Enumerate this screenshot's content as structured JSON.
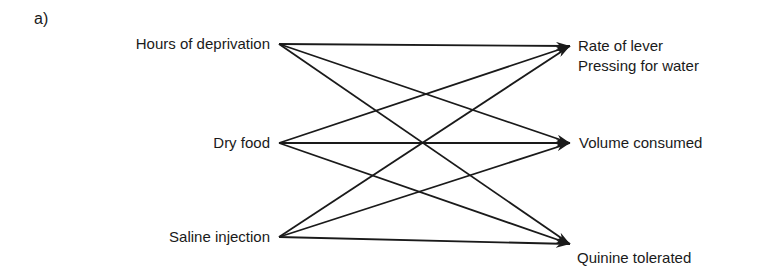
{
  "panel_label": "a)",
  "sources": [
    {
      "id": "hours",
      "label": "Hours of deprivation",
      "y": 44
    },
    {
      "id": "dry",
      "label": "Dry food",
      "y": 143
    },
    {
      "id": "saline",
      "label": "Saline injection",
      "y": 237
    }
  ],
  "targets": [
    {
      "id": "rate",
      "label_line1": "Rate of lever",
      "label_line2": "Pressing for water",
      "y": 46
    },
    {
      "id": "volume",
      "label": "Volume consumed",
      "y": 143
    },
    {
      "id": "quinine",
      "label": "Quinine tolerated",
      "y": 244
    }
  ],
  "edges": [
    {
      "from": "hours",
      "to": "rate"
    },
    {
      "from": "hours",
      "to": "volume"
    },
    {
      "from": "hours",
      "to": "quinine"
    },
    {
      "from": "dry",
      "to": "rate"
    },
    {
      "from": "dry",
      "to": "volume"
    },
    {
      "from": "dry",
      "to": "quinine"
    },
    {
      "from": "saline",
      "to": "rate"
    },
    {
      "from": "saline",
      "to": "volume"
    },
    {
      "from": "saline",
      "to": "quinine"
    }
  ],
  "colors": {
    "ink": "#1a1a1a",
    "background": "#ffffff"
  }
}
